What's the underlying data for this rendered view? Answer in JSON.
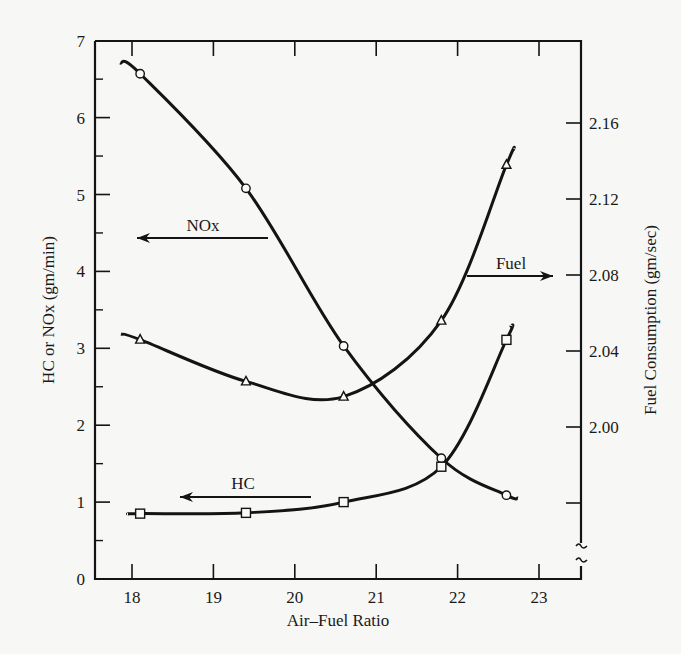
{
  "chart_data": {
    "type": "line",
    "title": "",
    "xlabel": "Air–Fuel Ratio",
    "ylabel": "HC or NOx (gm/min)",
    "y2label": "Fuel Consumption (gm/sec)",
    "xlim": [
      17.55,
      23.55
    ],
    "ylim": [
      0,
      7
    ],
    "y2lim": [
      1.96,
      2.19
    ],
    "y2_axis_break": true,
    "grid": false,
    "x_ticks": [
      18,
      19,
      20,
      21,
      22,
      23
    ],
    "y_ticks": [
      0,
      1,
      2,
      3,
      4,
      5,
      6,
      7
    ],
    "y_minor_ticks": [
      0.5,
      1.5,
      2.5,
      3.5,
      4.5,
      5.5,
      6.5
    ],
    "y2_ticks": [
      1.96,
      2.0,
      2.04,
      2.08,
      2.12,
      2.16
    ],
    "y2_tick_labels": [
      "",
      "2.00",
      "2.04",
      "2.08",
      "2.12",
      "2.16"
    ],
    "x": [
      18.1,
      19.4,
      20.6,
      21.8,
      22.6
    ],
    "series": [
      {
        "name": "NOx",
        "axis": "left",
        "marker": "circle",
        "values": [
          6.57,
          5.08,
          3.03,
          1.57,
          1.09
        ]
      },
      {
        "name": "HC",
        "axis": "left",
        "marker": "square",
        "values": [
          0.85,
          0.86,
          1.0,
          1.46,
          3.11
        ]
      },
      {
        "name": "Fuel",
        "axis": "right",
        "marker": "triangle",
        "values": [
          2.046,
          2.024,
          2.016,
          2.056,
          2.138
        ]
      }
    ],
    "annotations": [
      {
        "text": "NOx",
        "arrow": "left",
        "points_to": "left axis"
      },
      {
        "text": "HC",
        "arrow": "left",
        "points_to": "left axis"
      },
      {
        "text": "Fuel",
        "arrow": "right",
        "points_to": "right axis"
      }
    ]
  }
}
